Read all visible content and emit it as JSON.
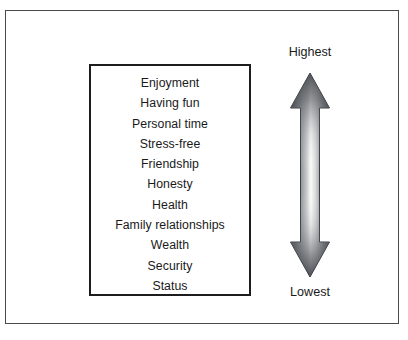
{
  "diagram": {
    "title_present": false,
    "values_box": {
      "name": "values-ranking-box",
      "items": [
        "Enjoyment",
        "Having fun",
        "Personal time",
        "Stress-free",
        "Friendship",
        "Honesty",
        "Health",
        "Family relationships",
        "Wealth",
        "Security",
        "Status"
      ]
    },
    "scale": {
      "top_label": "Highest",
      "bottom_label": "Lowest",
      "arrow_icon": "double-headed-vertical-arrow-icon"
    },
    "colors": {
      "outer_border": "#4a4a4a",
      "inner_border": "#1d1d1d",
      "text": "#1a1a1a",
      "arrow_dark": "#4a4d52",
      "arrow_light": "#fbfbfb",
      "background": "#ffffff"
    }
  }
}
